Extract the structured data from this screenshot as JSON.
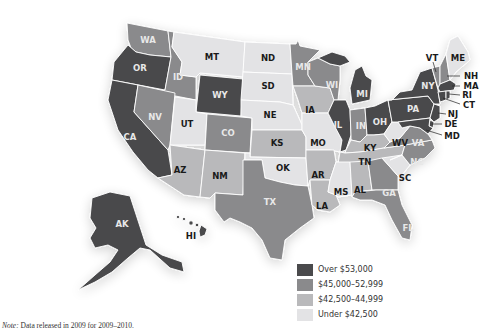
{
  "colors": {
    "over_53000": "#4a4a4c",
    "range_45000_52999": "#8a8a8c",
    "range_42500_44999": "#b9b9bb",
    "under_42500": "#e3e3e5"
  },
  "legend": {
    "items": [
      {
        "label": "Over $53,000",
        "key": "over_53000"
      },
      {
        "label": "$45,000–52,999",
        "key": "range_45000_52999"
      },
      {
        "label": "$42,500–44,999",
        "key": "range_42500_44999"
      },
      {
        "label": "Under $42,500",
        "key": "under_42500"
      }
    ]
  },
  "note": {
    "prefix": "Note:",
    "text": " Data released in 2009 for 2009–2010."
  },
  "states": {
    "WA": {
      "label": "WA",
      "tier": "range_45000_52999"
    },
    "OR": {
      "label": "OR",
      "tier": "over_53000"
    },
    "CA": {
      "label": "CA",
      "tier": "over_53000"
    },
    "ID": {
      "label": "ID",
      "tier": "range_45000_52999"
    },
    "NV": {
      "label": "NV",
      "tier": "range_45000_52999"
    },
    "MT": {
      "label": "MT",
      "tier": "under_42500"
    },
    "WY": {
      "label": "WY",
      "tier": "over_53000"
    },
    "UT": {
      "label": "UT",
      "tier": "under_42500"
    },
    "CO": {
      "label": "CO",
      "tier": "range_45000_52999"
    },
    "AZ": {
      "label": "AZ",
      "tier": "range_42500_44999"
    },
    "NM": {
      "label": "NM",
      "tier": "range_42500_44999"
    },
    "ND": {
      "label": "ND",
      "tier": "under_42500"
    },
    "SD": {
      "label": "SD",
      "tier": "under_42500"
    },
    "NE": {
      "label": "NE",
      "tier": "under_42500"
    },
    "KS": {
      "label": "KS",
      "tier": "range_42500_44999"
    },
    "OK": {
      "label": "OK",
      "tier": "under_42500"
    },
    "TX": {
      "label": "TX",
      "tier": "range_45000_52999"
    },
    "MN": {
      "label": "MN",
      "tier": "range_45000_52999"
    },
    "IA": {
      "label": "IA",
      "tier": "range_42500_44999"
    },
    "MO": {
      "label": "MO",
      "tier": "under_42500"
    },
    "AR": {
      "label": "AR",
      "tier": "range_42500_44999"
    },
    "LA": {
      "label": "LA",
      "tier": "range_42500_44999"
    },
    "WI": {
      "label": "WI",
      "tier": "range_45000_52999"
    },
    "IL": {
      "label": "IL",
      "tier": "over_53000"
    },
    "MI": {
      "label": "MI",
      "tier": "over_53000"
    },
    "IN": {
      "label": "IN",
      "tier": "range_45000_52999"
    },
    "OH": {
      "label": "OH",
      "tier": "over_53000"
    },
    "KY": {
      "label": "KY",
      "tier": "range_42500_44999"
    },
    "TN": {
      "label": "TN",
      "tier": "range_42500_44999"
    },
    "MS": {
      "label": "MS",
      "tier": "under_42500"
    },
    "AL": {
      "label": "AL",
      "tier": "range_42500_44999"
    },
    "GA": {
      "label": "GA",
      "tier": "range_45000_52999"
    },
    "FL": {
      "label": "FL",
      "tier": "range_45000_52999"
    },
    "SC": {
      "label": "SC",
      "tier": "under_42500"
    },
    "NC": {
      "label": "NC",
      "tier": "range_45000_52999"
    },
    "VA": {
      "label": "VA",
      "tier": "range_45000_52999"
    },
    "WV": {
      "label": "WV",
      "tier": "under_42500"
    },
    "PA": {
      "label": "PA",
      "tier": "over_53000"
    },
    "NY": {
      "label": "NY",
      "tier": "over_53000"
    },
    "VT": {
      "label": "VT",
      "tier": "range_45000_52999"
    },
    "NH": {
      "label": "NH",
      "tier": "range_45000_52999"
    },
    "ME": {
      "label": "ME",
      "tier": "under_42500"
    },
    "MA": {
      "label": "MA",
      "tier": "over_53000"
    },
    "RI": {
      "label": "RI",
      "tier": "over_53000"
    },
    "CT": {
      "label": "CT",
      "tier": "over_53000"
    },
    "NJ": {
      "label": "NJ",
      "tier": "over_53000"
    },
    "DE": {
      "label": "DE",
      "tier": "over_53000"
    },
    "MD": {
      "label": "MD",
      "tier": "over_53000"
    },
    "AK": {
      "label": "AK",
      "tier": "over_53000"
    },
    "HI": {
      "label": "HI",
      "tier": "over_53000"
    }
  }
}
